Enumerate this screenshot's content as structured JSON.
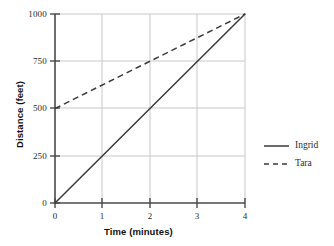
{
  "chart_data": {
    "type": "line",
    "title": "",
    "xlabel": "Time (minutes)",
    "ylabel": "Distance (feet)",
    "xlim": [
      0,
      4
    ],
    "ylim": [
      0,
      1000
    ],
    "xticks": [
      "0",
      "1",
      "2",
      "3",
      "4"
    ],
    "xtick_values": [
      0,
      1,
      2,
      3,
      4
    ],
    "yticks": [
      "0",
      "250",
      "500",
      "750",
      "1000"
    ],
    "ytick_values": [
      0,
      250,
      500,
      750,
      1000
    ],
    "grid": true,
    "grid_color": "#c8c8c8",
    "legend_position": "right",
    "x": [
      0,
      4
    ],
    "series": [
      {
        "name": "Ingrid",
        "style": "solid",
        "color": "#3a3a3a",
        "x": [
          0,
          4
        ],
        "values": [
          0,
          1000
        ],
        "points": [
          [
            0,
            0
          ],
          [
            1,
            250
          ],
          [
            2,
            500
          ],
          [
            3,
            750
          ],
          [
            4,
            1000
          ]
        ],
        "slope": 250,
        "intercept": 0
      },
      {
        "name": "Tara",
        "style": "dashed",
        "color": "#3a3a3a",
        "x": [
          0,
          4
        ],
        "values": [
          500,
          1000
        ],
        "points": [
          [
            0,
            500
          ],
          [
            1,
            625
          ],
          [
            2,
            750
          ],
          [
            3,
            875
          ],
          [
            4,
            1000
          ]
        ],
        "slope": 125,
        "intercept": 500
      }
    ]
  },
  "axes": {
    "x_title": "Time (minutes)",
    "y_title": "Distance (feet)",
    "x_tick_0": "0",
    "x_tick_1": "1",
    "x_tick_2": "2",
    "x_tick_3": "3",
    "x_tick_4": "4",
    "y_tick_0": "0",
    "y_tick_250": "250",
    "y_tick_500": "500",
    "y_tick_750": "750",
    "y_tick_1000": "1000"
  },
  "legend": {
    "items": [
      {
        "label": "Ingrid",
        "style": "solid"
      },
      {
        "label": "Tara",
        "style": "dashed"
      }
    ]
  },
  "colors": {
    "line": "#3a3a3a",
    "axis": "#4a4a4a",
    "grid": "#c8c8c8",
    "text": "#2b2b2b",
    "background": "#ffffff"
  }
}
